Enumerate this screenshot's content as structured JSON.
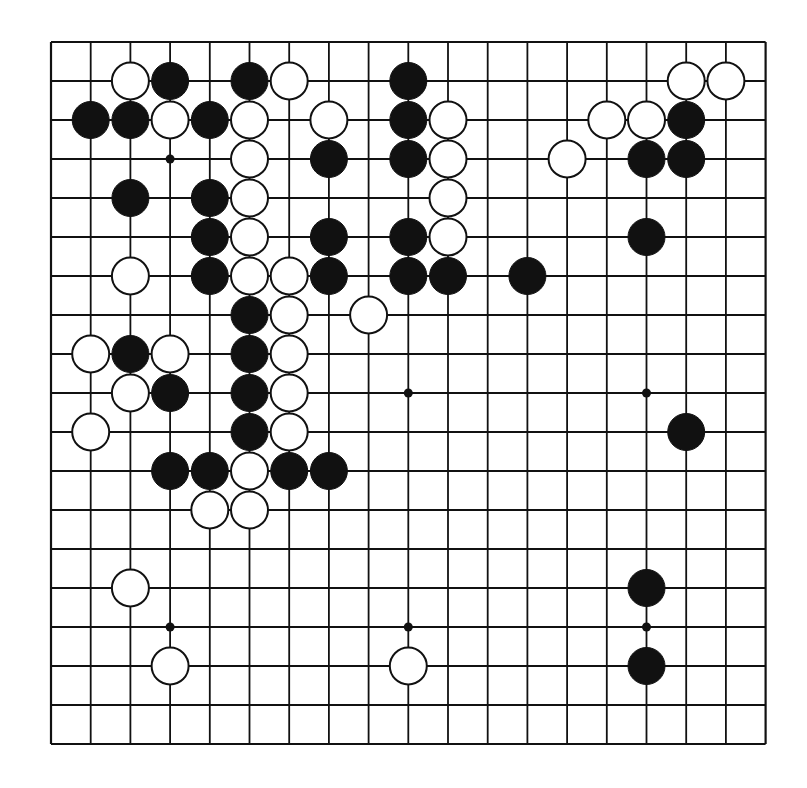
{
  "diagram": {
    "type": "go-board",
    "size": 19,
    "colors": {
      "background": "#ffffff",
      "line": "#111111",
      "black_stone": "#111111",
      "white_stone": "#ffffff",
      "stone_outline": "#111111"
    },
    "geometry": {
      "origin_x": 51,
      "origin_y": 42,
      "step_x": 39.7,
      "step_y": 39.0
    },
    "hoshi": [
      [
        3,
        3
      ],
      [
        9,
        9
      ],
      [
        15,
        9
      ],
      [
        3,
        15
      ],
      [
        9,
        15
      ],
      [
        15,
        15
      ]
    ],
    "stones": {
      "black": [
        [
          3,
          1
        ],
        [
          5,
          1
        ],
        [
          9,
          1
        ],
        [
          1,
          2
        ],
        [
          2,
          2
        ],
        [
          4,
          2
        ],
        [
          9,
          2
        ],
        [
          16,
          2
        ],
        [
          7,
          3
        ],
        [
          9,
          3
        ],
        [
          15,
          3
        ],
        [
          16,
          3
        ],
        [
          2,
          4
        ],
        [
          4,
          4
        ],
        [
          4,
          5
        ],
        [
          7,
          5
        ],
        [
          9,
          5
        ],
        [
          15,
          5
        ],
        [
          4,
          6
        ],
        [
          7,
          6
        ],
        [
          9,
          6
        ],
        [
          10,
          6
        ],
        [
          12,
          6
        ],
        [
          5,
          7
        ],
        [
          2,
          8
        ],
        [
          5,
          8
        ],
        [
          3,
          9
        ],
        [
          5,
          9
        ],
        [
          5,
          10
        ],
        [
          16,
          10
        ],
        [
          3,
          11
        ],
        [
          4,
          11
        ],
        [
          6,
          11
        ],
        [
          7,
          11
        ],
        [
          15,
          14
        ],
        [
          15,
          16
        ]
      ],
      "white": [
        [
          2,
          1
        ],
        [
          6,
          1
        ],
        [
          16,
          1
        ],
        [
          17,
          1
        ],
        [
          3,
          2
        ],
        [
          5,
          2
        ],
        [
          7,
          2
        ],
        [
          10,
          2
        ],
        [
          14,
          2
        ],
        [
          15,
          2
        ],
        [
          5,
          3
        ],
        [
          10,
          3
        ],
        [
          13,
          3
        ],
        [
          5,
          4
        ],
        [
          10,
          4
        ],
        [
          5,
          5
        ],
        [
          10,
          5
        ],
        [
          2,
          6
        ],
        [
          5,
          6
        ],
        [
          6,
          6
        ],
        [
          6,
          7
        ],
        [
          8,
          7
        ],
        [
          1,
          8
        ],
        [
          3,
          8
        ],
        [
          6,
          8
        ],
        [
          2,
          9
        ],
        [
          6,
          9
        ],
        [
          1,
          10
        ],
        [
          6,
          10
        ],
        [
          5,
          11
        ],
        [
          4,
          12
        ],
        [
          5,
          12
        ],
        [
          2,
          14
        ],
        [
          3,
          16
        ],
        [
          9,
          16
        ]
      ]
    }
  }
}
